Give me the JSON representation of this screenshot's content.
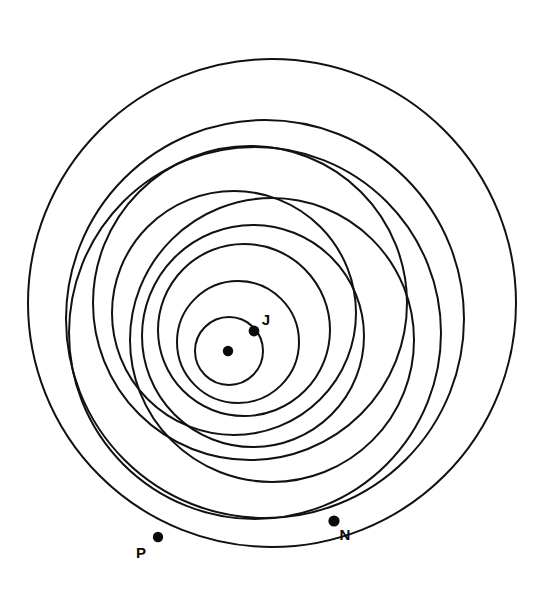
{
  "figure": {
    "background_color": "#ffffff",
    "stroke_color": "#111111",
    "width": 544,
    "height": 591
  },
  "chart_data": {
    "type": "scatter",
    "xlabel": "",
    "ylabel": "",
    "grid": false,
    "legend": "none",
    "units": "pixels",
    "center_marker": {
      "name": "sun",
      "label": "",
      "cx": 228,
      "cy": 351,
      "r": 5.2
    },
    "orbits": [
      {
        "name": "orbit-1-innermost",
        "cx": 229,
        "cy": 351,
        "r": 34,
        "stroke_width": 2.0
      },
      {
        "name": "orbit-2",
        "cx": 238,
        "cy": 342,
        "r": 61,
        "stroke_width": 2.0
      },
      {
        "name": "orbit-3",
        "cx": 244,
        "cy": 330,
        "r": 86,
        "stroke_width": 2.0
      },
      {
        "name": "orbit-4",
        "cx": 253,
        "cy": 336,
        "r": 111,
        "stroke_width": 2.0
      },
      {
        "name": "orbit-5",
        "cx": 234,
        "cy": 313,
        "r": 122,
        "stroke_width": 2.0
      },
      {
        "name": "orbit-6",
        "cx": 272,
        "cy": 340,
        "r": 142,
        "stroke_width": 2.0
      },
      {
        "name": "orbit-7",
        "cx": 250,
        "cy": 303,
        "r": 157,
        "stroke_width": 2.0
      },
      {
        "name": "orbit-8",
        "cx": 255,
        "cy": 333,
        "r": 186,
        "stroke_width": 2.0
      },
      {
        "name": "orbit-9",
        "cx": 265,
        "cy": 319,
        "r": 199,
        "stroke_width": 2.0
      },
      {
        "name": "orbit-10-outermost",
        "cx": 272,
        "cy": 303,
        "r": 244,
        "stroke_width": 2.0
      }
    ],
    "points": [
      {
        "name": "jupiter",
        "label": "J",
        "x": 254,
        "y": 331,
        "r": 5.4,
        "label_x": 266,
        "label_y": 325,
        "label_size": 15
      },
      {
        "name": "neptune",
        "label": "N",
        "x": 334,
        "y": 521,
        "r": 5.6,
        "label_x": 345,
        "label_y": 540,
        "label_size": 15
      },
      {
        "name": "pluto",
        "label": "P",
        "x": 158,
        "y": 537,
        "r": 5.2,
        "label_x": 141,
        "label_y": 558,
        "label_size": 15
      }
    ]
  }
}
